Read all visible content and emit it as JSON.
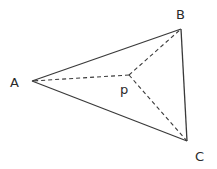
{
  "diagram": {
    "type": "triangle-with-interior-point",
    "stroke_color": "#3a3a3a",
    "vertices": {
      "A": {
        "label": "A",
        "x": 32,
        "y": 81
      },
      "B": {
        "label": "B",
        "x": 181,
        "y": 29
      },
      "C": {
        "label": "C",
        "x": 187,
        "y": 141
      }
    },
    "interior_point": {
      "label": "p",
      "x": 129,
      "y": 75
    },
    "solid_edges": [
      "AB",
      "BC",
      "CA"
    ],
    "dashed_edges": [
      "pA",
      "pB",
      "pC"
    ]
  },
  "labels": {
    "A": "A",
    "B": "B",
    "C": "C",
    "p": "p"
  }
}
